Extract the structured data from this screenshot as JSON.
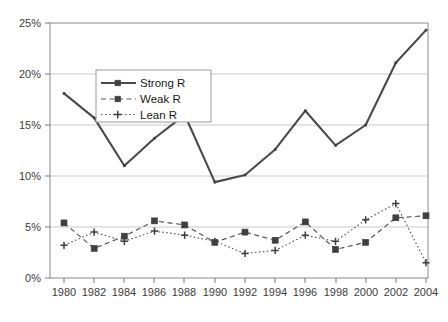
{
  "chart_data": {
    "type": "line",
    "title": "",
    "subtitle": "",
    "xlabel": "",
    "ylabel": "",
    "categories": [
      "1980",
      "1982",
      "1984",
      "1986",
      "1988",
      "1990",
      "1992",
      "1994",
      "1996",
      "1998",
      "2000",
      "2002",
      "2004"
    ],
    "x": [
      1980,
      1982,
      1984,
      1986,
      1988,
      1990,
      1992,
      1994,
      1996,
      1998,
      2000,
      2002,
      2004
    ],
    "series": [
      {
        "name": "Strong R",
        "style": "solid",
        "marker": "square-small",
        "color": "#4a4a4a",
        "values": [
          18.1,
          15.7,
          11.0,
          13.7,
          16.0,
          9.4,
          10.1,
          12.6,
          16.4,
          13.0,
          15.0,
          21.1,
          24.3
        ]
      },
      {
        "name": "Weak R",
        "style": "dashed",
        "marker": "square",
        "color": "#565656",
        "values": [
          5.4,
          2.9,
          4.1,
          5.6,
          5.2,
          3.5,
          4.5,
          3.7,
          5.5,
          2.8,
          3.5,
          5.9,
          6.1
        ]
      },
      {
        "name": "Lean R",
        "style": "dotted",
        "marker": "plus",
        "color": "#5e5e5e",
        "values": [
          3.2,
          4.5,
          3.6,
          4.6,
          4.2,
          3.6,
          2.4,
          2.7,
          4.2,
          3.6,
          5.7,
          7.3,
          1.5
        ]
      }
    ],
    "ylim": [
      0,
      25
    ],
    "yticks": [
      0,
      5,
      10,
      15,
      20,
      25
    ],
    "ytick_labels": [
      "0%",
      "5%",
      "10%",
      "15%",
      "20%",
      "25%"
    ],
    "xtick_labels": [
      "1980",
      "1982",
      "1984",
      "1986",
      "1988",
      "1990",
      "1992",
      "1994",
      "1996",
      "1998",
      "2000",
      "2002",
      "2004"
    ],
    "grid": "horizontal",
    "legend_position": "upper-left-inside",
    "legend_entries": [
      "Strong R",
      "Weak R",
      "Lean R"
    ],
    "background": "#ffffff",
    "gridline_color": "#c9c9c9",
    "border_color": "#8a8a8a"
  },
  "axes": {
    "y_tick_0": "0%",
    "y_tick_1": "5%",
    "y_tick_2": "10%",
    "y_tick_3": "15%",
    "y_tick_4": "20%",
    "y_tick_5": "25%",
    "x_tick_0": "1980",
    "x_tick_1": "1982",
    "x_tick_2": "1984",
    "x_tick_3": "1986",
    "x_tick_4": "1988",
    "x_tick_5": "1990",
    "x_tick_6": "1992",
    "x_tick_7": "1994",
    "x_tick_8": "1996",
    "x_tick_9": "1998",
    "x_tick_10": "2000",
    "x_tick_11": "2002",
    "x_tick_12": "2004"
  },
  "legend": {
    "item_0": "Strong R",
    "item_1": "Weak R",
    "item_2": "Lean R"
  }
}
